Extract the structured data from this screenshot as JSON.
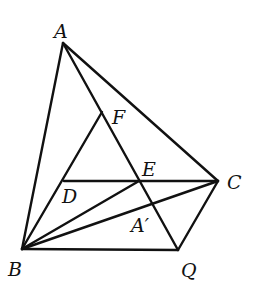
{
  "diagram": {
    "type": "geometry",
    "stroke_color": "#111111",
    "background": "#ffffff",
    "points": {
      "A": {
        "label": "A",
        "x": 63,
        "y": 43,
        "lx": 54,
        "ly": 38
      },
      "B": {
        "label": "B",
        "x": 22,
        "y": 249,
        "lx": 8,
        "ly": 276
      },
      "C": {
        "label": "C",
        "x": 218,
        "y": 181,
        "lx": 227,
        "ly": 189
      },
      "Q": {
        "label": "Q",
        "x": 178,
        "y": 250,
        "lx": 181,
        "ly": 277
      },
      "F": {
        "label": "F",
        "x": 102,
        "y": 112,
        "lx": 112,
        "ly": 124
      },
      "E": {
        "label": "E",
        "x": 139,
        "y": 181,
        "lx": 142,
        "ly": 176
      },
      "D": {
        "label": "D",
        "x": 64,
        "y": 181,
        "lx": 62,
        "ly": 203
      },
      "A_prime": {
        "label": "A′",
        "x": 152,
        "y": 202,
        "lx": 131,
        "ly": 232
      }
    },
    "segments": [
      {
        "name": "segment-AB",
        "from": "A",
        "to": "B"
      },
      {
        "name": "segment-AC",
        "from": "A",
        "to": "C"
      },
      {
        "name": "segment-AQ",
        "from": "A",
        "to": "Q"
      },
      {
        "name": "segment-BQ",
        "from": "B",
        "to": "Q"
      },
      {
        "name": "segment-CQ",
        "from": "C",
        "to": "Q"
      },
      {
        "name": "segment-DC",
        "from": "D",
        "to": "C"
      },
      {
        "name": "segment-BF",
        "from": "B",
        "to": "F"
      },
      {
        "name": "segment-BE",
        "from": "B",
        "to": "E"
      },
      {
        "name": "segment-BC",
        "from": "B",
        "to": "C"
      }
    ]
  }
}
